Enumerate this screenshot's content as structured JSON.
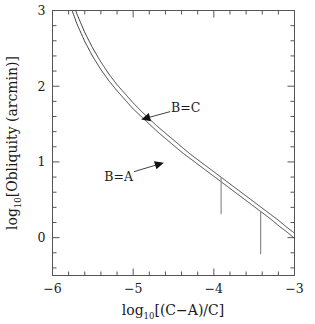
{
  "chart_data": {
    "type": "line",
    "title": "",
    "xlabel": "log10[(C-A)/C]",
    "xlabel_parts": {
      "base": "log",
      "subscript": "10",
      "rest": "[(C−A)/C]"
    },
    "ylabel": "log10[Obliquity (arcmin)]",
    "ylabel_parts": {
      "base": "log",
      "subscript": "10",
      "rest": "[Obliquity (arcmin)]"
    },
    "xlim": [
      -6,
      -3
    ],
    "ylim": [
      -0.5,
      3
    ],
    "xticks": [
      -6,
      -5,
      -4,
      -3
    ],
    "xticklabels": [
      "−6",
      "−5",
      "−4",
      "−3"
    ],
    "yticks": [
      0,
      1,
      2,
      3
    ],
    "yticklabels": [
      "0",
      "1",
      "2",
      "3"
    ],
    "minor_tick_step_x": 0.2,
    "minor_tick_step_y": 0.2,
    "grid": false,
    "legend_position": "inline-annotations",
    "series": [
      {
        "name": "B=C",
        "label": "B=C",
        "comment": "upper curve",
        "x": [
          -6.0,
          -5.9,
          -5.8,
          -5.7,
          -5.6,
          -5.5,
          -5.4,
          -5.3,
          -5.2,
          -5.1,
          -5.0,
          -4.9,
          -4.8,
          -4.7,
          -4.6,
          -4.5,
          -4.4,
          -4.3,
          -4.2,
          -4.1,
          -4.0,
          -3.9,
          -3.8,
          -3.7,
          -3.6,
          -3.5,
          -3.4,
          -3.3,
          -3.2,
          -3.1,
          -3.0
        ],
        "y": [
          4.35,
          3.72,
          3.28,
          2.96,
          2.71,
          2.5,
          2.32,
          2.16,
          2.02,
          1.9,
          1.78,
          1.67,
          1.57,
          1.47,
          1.38,
          1.29,
          1.2,
          1.11,
          1.03,
          0.95,
          0.87,
          0.79,
          0.71,
          0.63,
          0.55,
          0.47,
          0.39,
          0.31,
          0.23,
          0.14,
          0.06
        ]
      },
      {
        "name": "B=A",
        "label": "B=A",
        "comment": "lower curve",
        "x": [
          -6.0,
          -5.9,
          -5.8,
          -5.7,
          -5.6,
          -5.5,
          -5.4,
          -5.3,
          -5.2,
          -5.1,
          -5.0,
          -4.9,
          -4.8,
          -4.7,
          -4.6,
          -4.5,
          -4.4,
          -4.3,
          -4.2,
          -4.1,
          -4.0,
          -3.9,
          -3.8,
          -3.7,
          -3.6,
          -3.5,
          -3.4,
          -3.3,
          -3.2,
          -3.1,
          -3.0
        ],
        "y": [
          4.12,
          3.54,
          3.13,
          2.83,
          2.59,
          2.39,
          2.22,
          2.07,
          1.94,
          1.82,
          1.7,
          1.6,
          1.5,
          1.4,
          1.31,
          1.22,
          1.13,
          1.05,
          0.97,
          0.89,
          0.81,
          0.73,
          0.65,
          0.57,
          0.49,
          0.41,
          0.33,
          0.25,
          0.16,
          0.08,
          -0.01
        ]
      }
    ],
    "annotations": [
      {
        "name": "B=C",
        "text": "B=C",
        "text_x": -4.35,
        "text_y": 1.72,
        "arrow_to_x": -4.9,
        "arrow_to_y": 1.56
      },
      {
        "name": "B=A",
        "text": "B=A",
        "text_x": -5.18,
        "text_y": 0.81,
        "arrow_to_x": -4.62,
        "arrow_to_y": 0.99
      }
    ],
    "error_bars": [
      {
        "name": "error-bar-1",
        "x": -3.91,
        "y_center": 0.545,
        "y_low": 0.31,
        "y_high": 0.8
      },
      {
        "name": "error-bar-2",
        "x": -3.42,
        "y_center": 0.065,
        "y_low": -0.22,
        "y_high": 0.35
      }
    ],
    "colors": {
      "curve": "#3d3d3d",
      "axis": "#555555",
      "error_bar": "#8c8c8c",
      "background": "#ffffff",
      "text": "#1a1a1a"
    }
  }
}
